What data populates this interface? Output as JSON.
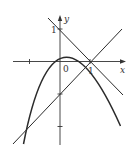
{
  "diagram": {
    "type": "function-graph",
    "axes": {
      "x_label": "x",
      "y_label": "y",
      "origin_label": "0",
      "x_ticks": [
        {
          "value": -1,
          "label": ""
        },
        {
          "value": 1,
          "label": "1"
        }
      ],
      "y_ticks": [
        {
          "value": 1,
          "label": "1"
        },
        {
          "value": -1,
          "label": ""
        },
        {
          "value": -2,
          "label": ""
        }
      ]
    },
    "curves": [
      {
        "name": "parabola",
        "equation": "y = x - x^2",
        "color": "#2b2b2b"
      },
      {
        "name": "line-decreasing",
        "equation": "y = -x + 1",
        "color": "#2b2b2b"
      },
      {
        "name": "line-increasing",
        "equation": "y = x - 1",
        "color": "#2b2b2b"
      }
    ],
    "labels": {
      "x": "x",
      "y": "y",
      "origin": "0",
      "one_x": "1",
      "one_y": "1"
    }
  }
}
